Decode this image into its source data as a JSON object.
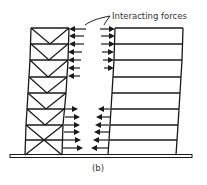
{
  "figure": {
    "annotation": "Interacting forces",
    "caption": "(b)"
  },
  "colors": {
    "line": "#1a1a1a",
    "background": "#ffffff",
    "text": "#333333"
  },
  "left_building": {
    "type": "braced-frame",
    "stories": 8,
    "bracing": [
      "V",
      "V",
      "V",
      "V",
      "V",
      "V",
      "X"
    ]
  },
  "right_building": {
    "type": "rigid-frame",
    "stories": 8
  },
  "forces": {
    "upper_zone": "buildings pulled toward each other",
    "lower_zone": "buildings pushed apart"
  }
}
